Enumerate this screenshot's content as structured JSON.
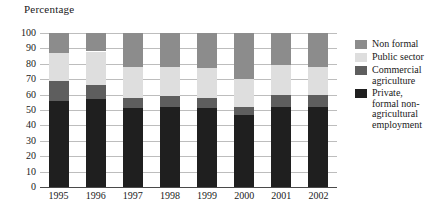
{
  "axis": {
    "y_title": "Percentage",
    "y_ticks": [
      "100",
      "90",
      "80",
      "70",
      "60",
      "50",
      "40",
      "30",
      "20",
      "10",
      "0"
    ]
  },
  "legend": {
    "items": [
      {
        "label": "Non formal",
        "color": "#8c8c8c",
        "key": "non_formal"
      },
      {
        "label": "Public sector",
        "color": "#dedede",
        "key": "public_sector"
      },
      {
        "label": "Commercial\nagriculture",
        "color": "#5e5e5e",
        "key": "commercial_agriculture"
      },
      {
        "label": "Private,\nformal non-\nagricultural\nemployment",
        "color": "#1f1f1f",
        "key": "private_formal"
      }
    ]
  },
  "chart_data": {
    "type": "bar",
    "stacked": true,
    "title": "",
    "xlabel": "",
    "ylabel": "Percentage",
    "ylim": [
      0,
      100
    ],
    "ytick_step": 10,
    "grid": true,
    "legend_position": "right",
    "categories": [
      "1995",
      "1996",
      "1997",
      "1998",
      "1999",
      "2000",
      "2001",
      "2002"
    ],
    "series": [
      {
        "name": "Private, formal non-agricultural employment",
        "color": "#1f1f1f",
        "values": [
          56,
          57,
          51,
          52,
          51,
          47,
          52,
          52
        ]
      },
      {
        "name": "Commercial agriculture",
        "color": "#5e5e5e",
        "values": [
          13,
          9,
          7,
          7,
          7,
          5,
          8,
          8
        ]
      },
      {
        "name": "Public sector",
        "color": "#dedede",
        "values": [
          18,
          22,
          20,
          19,
          19,
          18,
          19,
          18
        ]
      },
      {
        "name": "Non formal",
        "color": "#8c8c8c",
        "values": [
          13,
          12,
          22,
          22,
          23,
          30,
          21,
          22
        ]
      }
    ]
  }
}
